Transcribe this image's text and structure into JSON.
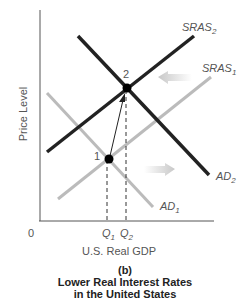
{
  "figure": {
    "panel": "(b)",
    "title_line1": "Lower Real Interest Rates",
    "title_line2": "in the United States"
  },
  "axes": {
    "ylabel": "Price Level",
    "xlabel": "U.S. Real GDP",
    "origin": "0",
    "q1": "Q",
    "q1_sub": "1",
    "q2": "Q",
    "q2_sub": "2"
  },
  "curves": {
    "sras2": {
      "name": "SRAS",
      "sub": "2",
      "color": "#222222"
    },
    "sras1": {
      "name": "SRAS",
      "sub": "1",
      "color": "#bbbbbb"
    },
    "ad2": {
      "name": "AD",
      "sub": "2",
      "color": "#222222"
    },
    "ad1": {
      "name": "AD",
      "sub": "1",
      "color": "#bbbbbb"
    }
  },
  "points": {
    "p1": "1",
    "p2": "2"
  },
  "shift_arrows": {
    "sras": "left",
    "ad": "right"
  }
}
